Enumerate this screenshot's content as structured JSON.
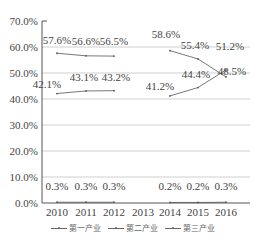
{
  "chart_data": {
    "type": "line",
    "title": "",
    "xlabel": "",
    "ylabel": "",
    "categories": [
      "2010",
      "2011",
      "2012",
      "2013",
      "2014",
      "2015",
      "2016"
    ],
    "y_ticks": [
      "0.0%",
      "10.0%",
      "20.0%",
      "30.0%",
      "40.0%",
      "50.0%",
      "60.0%",
      "70.0%"
    ],
    "ylim": [
      0,
      70
    ],
    "grid": true,
    "legend_position": "bottom",
    "series": [
      {
        "name": "第一产业",
        "values": [
          0.3,
          0.3,
          0.3,
          null,
          0.2,
          0.2,
          0.3
        ],
        "labels": [
          "0.3%",
          "0.3%",
          "0.3%",
          "",
          "0.2%",
          "0.2%",
          "0.3%"
        ]
      },
      {
        "name": "第二产业",
        "values": [
          57.6,
          56.6,
          56.5,
          null,
          58.6,
          55.4,
          48.5
        ],
        "labels": [
          "57.6%",
          "56.6%",
          "56.5%",
          "",
          "58.6%",
          "55.4%",
          "48.5%"
        ]
      },
      {
        "name": "第三产业",
        "values": [
          42.1,
          43.1,
          43.2,
          null,
          41.2,
          44.4,
          51.2
        ],
        "labels": [
          "42.1%",
          "43.1%",
          "43.2%",
          "",
          "41.2%",
          "44.4%",
          "51.2%"
        ]
      }
    ]
  },
  "legend": {
    "items": [
      "第一产业",
      "第二产业",
      "第三产业"
    ]
  }
}
